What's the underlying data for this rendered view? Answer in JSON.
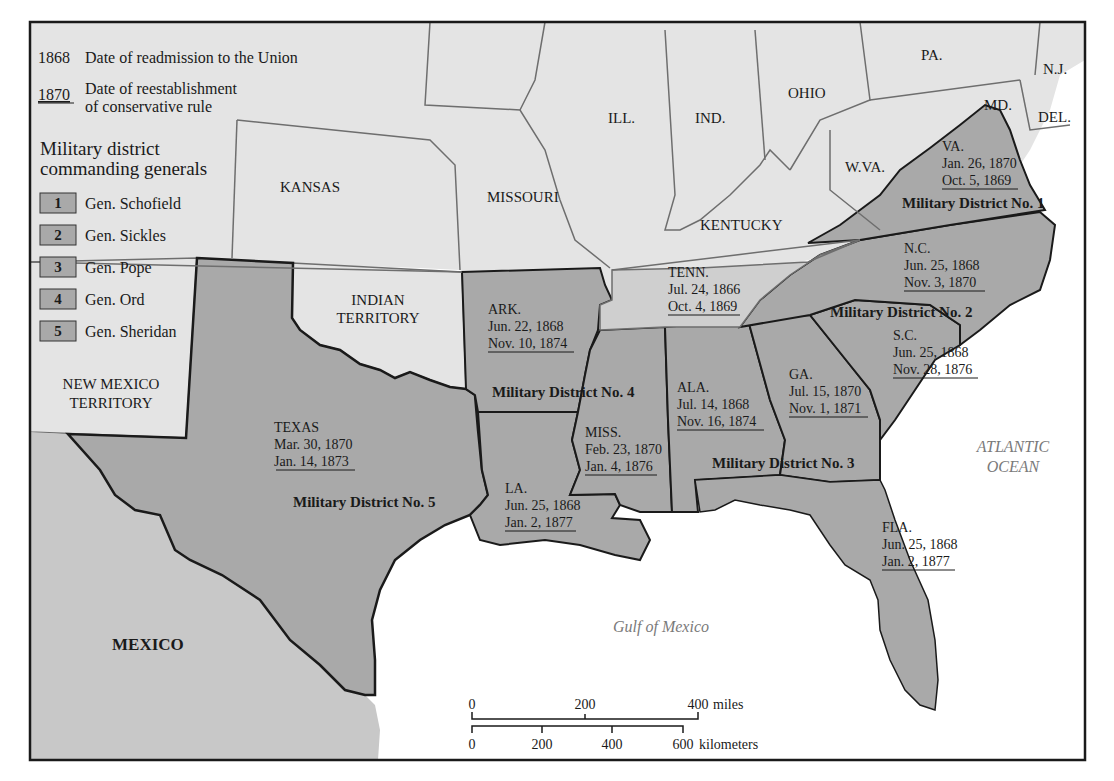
{
  "legend": {
    "readmission_year": "1868",
    "readmission_text": "Date of readmission to the Union",
    "conservative_year": "1870",
    "conservative_text_line1": "Date of reestablishment",
    "conservative_text_line2": "of conservative rule",
    "heading_line1": "Military district",
    "heading_line2": "commanding generals",
    "districts": [
      {
        "number": "1",
        "general": "Gen. Schofield"
      },
      {
        "number": "2",
        "general": "Gen. Sickles"
      },
      {
        "number": "3",
        "general": "Gen. Pope"
      },
      {
        "number": "4",
        "general": "Gen. Ord"
      },
      {
        "number": "5",
        "general": "Gen. Sheridan"
      }
    ]
  },
  "colors": {
    "union_land": "#e4e4e4",
    "former_confederate": "#a9a9a9",
    "tennessee": "#cfcfcf",
    "mexico": "#c8c8c8",
    "water": "#ffffff",
    "border": "#1a1a1a",
    "state_line": "#6e6e6e"
  },
  "nonconfederate_labels": {
    "kansas": "KANSAS",
    "missouri": "MISSOURI",
    "ill": "ILL.",
    "ind": "IND.",
    "ohio": "OHIO",
    "pa": "PA.",
    "nj": "N.J.",
    "md": "MD.",
    "del": "DEL.",
    "wva": "W.VA.",
    "kentucky": "KENTUCKY",
    "indian_territory_line1": "INDIAN",
    "indian_territory_line2": "TERRITORY",
    "new_mexico_line1": "NEW MEXICO",
    "new_mexico_line2": "TERRITORY",
    "mexico": "MEXICO"
  },
  "states": {
    "va": {
      "name": "VA.",
      "readmitted": "Jan. 26, 1870",
      "conservative": "Oct. 5, 1869"
    },
    "nc": {
      "name": "N.C.",
      "readmitted": "Jun. 25, 1868",
      "conservative": "Nov. 3, 1870"
    },
    "sc": {
      "name": "S.C.",
      "readmitted": "Jun. 25, 1868",
      "conservative": "Nov. 28, 1876"
    },
    "ga": {
      "name": "GA.",
      "readmitted": "Jul. 15, 1870",
      "conservative": "Nov. 1, 1871"
    },
    "fla": {
      "name": "FLA.",
      "readmitted": "Jun. 25, 1868",
      "conservative": "Jan. 2, 1877"
    },
    "ala": {
      "name": "ALA.",
      "readmitted": "Jul. 14, 1868",
      "conservative": "Nov. 16, 1874"
    },
    "miss": {
      "name": "MISS.",
      "readmitted": "Feb. 23, 1870",
      "conservative": "Jan. 4, 1876"
    },
    "la": {
      "name": "LA.",
      "readmitted": "Jun. 25, 1868",
      "conservative": "Jan. 2, 1877"
    },
    "ark": {
      "name": "ARK.",
      "readmitted": "Jun. 22, 1868",
      "conservative": "Nov. 10, 1874"
    },
    "tenn": {
      "name": "TENN.",
      "readmitted": "Jul. 24, 1866",
      "conservative": "Oct. 4, 1869"
    },
    "texas": {
      "name": "TEXAS",
      "readmitted": "Mar. 30, 1870",
      "conservative": "Jan. 14, 1873"
    }
  },
  "district_labels": {
    "d1": "Military District No. 1",
    "d2": "Military District No. 2",
    "d3": "Military District No. 3",
    "d4": "Military District No. 4",
    "d5": "Military District No. 5"
  },
  "water_labels": {
    "atlantic_line1": "ATLANTIC",
    "atlantic_line2": "OCEAN",
    "gulf": "Gulf of Mexico"
  },
  "scale": {
    "miles_ticks": [
      "0",
      "200",
      "400"
    ],
    "miles_unit": "miles",
    "km_ticks": [
      "0",
      "200",
      "400",
      "600"
    ],
    "km_unit": "kilometers"
  }
}
